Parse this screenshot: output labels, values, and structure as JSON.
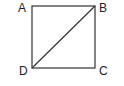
{
  "diagram": {
    "type": "geometry",
    "shape": "square",
    "stroke_color": "#333333",
    "vertices": [
      {
        "label": "A",
        "x": 32,
        "y": 6
      },
      {
        "label": "B",
        "x": 95,
        "y": 6
      },
      {
        "label": "C",
        "x": 95,
        "y": 68
      },
      {
        "label": "D",
        "x": 32,
        "y": 68
      }
    ],
    "edges": [
      {
        "from": "A",
        "to": "B"
      },
      {
        "from": "B",
        "to": "C"
      },
      {
        "from": "C",
        "to": "D"
      },
      {
        "from": "D",
        "to": "A"
      }
    ],
    "diagonals": [
      {
        "from": "D",
        "to": "B"
      }
    ],
    "labels": {
      "a": "A",
      "b": "B",
      "c": "C",
      "d": "D"
    }
  }
}
